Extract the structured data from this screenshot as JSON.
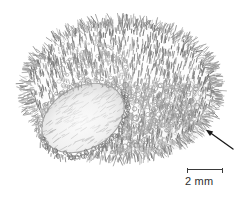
{
  "figure": {
    "kind": "scientific-line-drawing",
    "background_color": "#ffffff",
    "ink_color": "#8d8d8d",
    "dark_ink_color": "#5a5a5a",
    "annotation_color": "#1a1a1a"
  },
  "specimen": {
    "body_label": "specimen-body",
    "aperture_label": "aperture-opening",
    "surface_label": "hair-like-surface-texture",
    "rim_label": "aperture-rim"
  },
  "annotation": {
    "arrow_name": "pointer-arrow",
    "arrow_direction": "up-left",
    "arrow_tip_x": 206,
    "arrow_tip_y": 130,
    "arrow_tail_x": 233,
    "arrow_tail_y": 149
  },
  "scale_bar": {
    "label": "2 mm",
    "value": 2,
    "unit": "mm",
    "bar_length_px": 36,
    "color": "#3a3a3a"
  }
}
